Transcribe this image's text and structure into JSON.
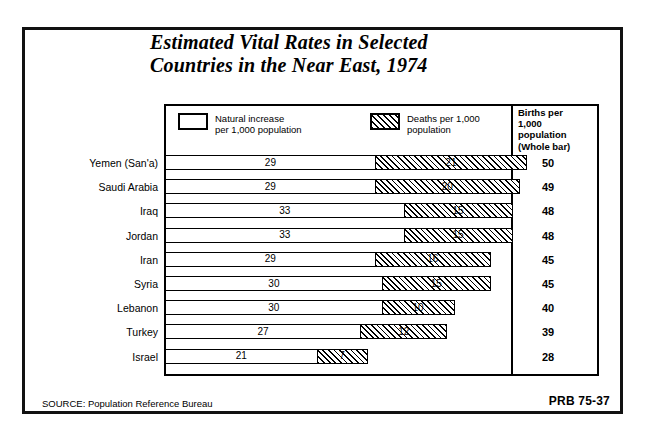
{
  "title": {
    "line1": "Estimated Vital Rates in Selected",
    "line2": "Countries in the Near East, 1974"
  },
  "legend": {
    "natural": {
      "swatch": "open-rectangle",
      "label": "Natural increase\nper 1,000 population"
    },
    "deaths": {
      "swatch": "hatched-rectangle",
      "label": "Deaths per 1,000\npopulation"
    }
  },
  "births_column_header": "Births per\n1,000\npopulation\n(Whole bar)",
  "footer": {
    "source": "SOURCE: Population Reference Bureau",
    "code": "PRB 75-37"
  },
  "chart_data": {
    "type": "bar",
    "orientation": "horizontal",
    "stacked": true,
    "title": "Estimated Vital Rates in Selected Countries in the Near East, 1974",
    "xlabel": "",
    "ylabel": "",
    "xlim": [
      0,
      50
    ],
    "grid": false,
    "legend_position": "top",
    "categories": [
      "Yemen (San'a)",
      "Saudi Arabia",
      "Iraq",
      "Jordan",
      "Iran",
      "Syria",
      "Lebanon",
      "Turkey",
      "Israel"
    ],
    "series": [
      {
        "name": "Natural increase per 1,000 population",
        "values": [
          29,
          29,
          33,
          33,
          29,
          30,
          30,
          27,
          21
        ]
      },
      {
        "name": "Deaths per 1,000 population",
        "values": [
          21,
          20,
          15,
          15,
          16,
          15,
          10,
          12,
          7
        ]
      }
    ],
    "totals_label": "Births per 1,000 population (Whole bar)",
    "totals": [
      50,
      49,
      48,
      48,
      45,
      45,
      40,
      39,
      28
    ],
    "rows": [
      {
        "country": "Yemen (San'a)",
        "natural": 29,
        "deaths": 21,
        "births": 50
      },
      {
        "country": "Saudi Arabia",
        "natural": 29,
        "deaths": 20,
        "births": 49
      },
      {
        "country": "Iraq",
        "natural": 33,
        "deaths": 15,
        "births": 48
      },
      {
        "country": "Jordan",
        "natural": 33,
        "deaths": 15,
        "births": 48
      },
      {
        "country": "Iran",
        "natural": 29,
        "deaths": 16,
        "births": 45
      },
      {
        "country": "Syria",
        "natural": 30,
        "deaths": 15,
        "births": 45
      },
      {
        "country": "Lebanon",
        "natural": 30,
        "deaths": 10,
        "births": 40
      },
      {
        "country": "Turkey",
        "natural": 27,
        "deaths": 12,
        "births": 39
      },
      {
        "country": "Israel",
        "natural": 21,
        "deaths": 7,
        "births": 28
      }
    ]
  },
  "colors": {
    "ink": "#000000",
    "paper": "#ffffff"
  }
}
